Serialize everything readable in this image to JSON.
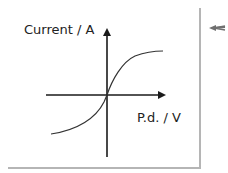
{
  "diagram": {
    "type": "I-V characteristic sketch",
    "y_axis_label": "Current / A",
    "x_axis_label": "P.d. / V",
    "curve_shape": "s-shaped through origin, flattening at both ends",
    "colors": {
      "axis": "#1a1a1a",
      "curve": "#333333",
      "frame_border": "#b5b5b5",
      "pointer_arrow": "#707070"
    },
    "pointer_icon": "left-arrow-icon"
  }
}
